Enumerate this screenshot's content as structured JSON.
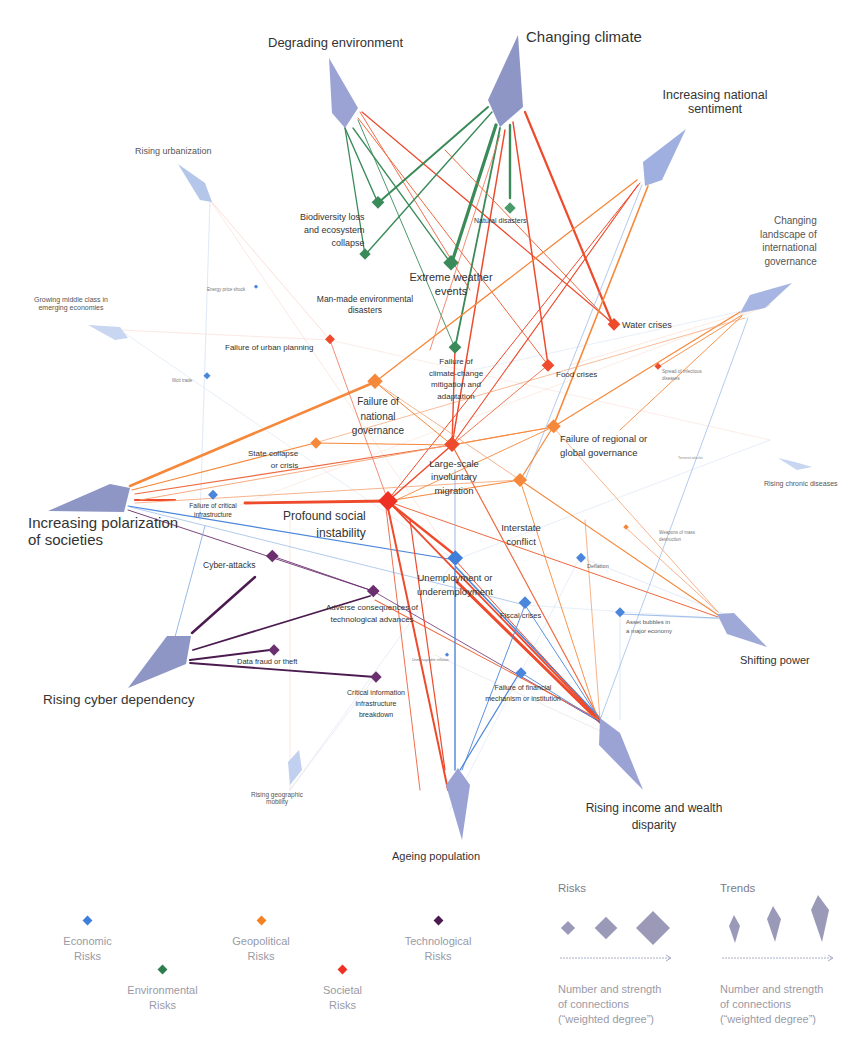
{
  "trends": [
    {
      "id": "degrading_environment",
      "label": "Degrading environment",
      "size": "xl"
    },
    {
      "id": "changing_climate",
      "label": "Changing climate",
      "size": "xl"
    },
    {
      "id": "increasing_national_sentiment",
      "label": "Increasing national sentiment",
      "size": "l"
    },
    {
      "id": "rising_urbanization",
      "label": "Rising urbanization",
      "size": "s"
    },
    {
      "id": "changing_landscape_intl_governance",
      "label": "Changing landscape of international governance",
      "size": "l"
    },
    {
      "id": "growing_middle_class",
      "label": "Growing middle class in emerging economies",
      "size": "s"
    },
    {
      "id": "rising_chronic_diseases",
      "label": "Rising chronic diseases",
      "size": "s"
    },
    {
      "id": "increasing_polarization",
      "label": "Increasing polarization of societies",
      "size": "xl"
    },
    {
      "id": "shifting_power",
      "label": "Shifting power",
      "size": "l"
    },
    {
      "id": "rising_cyber_dependency",
      "label": "Rising cyber dependency",
      "size": "xl"
    },
    {
      "id": "rising_geographic_mobility",
      "label": "Rising geographic mobility",
      "size": "s"
    },
    {
      "id": "ageing_population",
      "label": "Ageing population",
      "size": "l"
    },
    {
      "id": "rising_income_wealth_disparity",
      "label": "Rising income and wealth disparity",
      "size": "xl"
    }
  ],
  "risks": [
    {
      "id": "biodiversity_loss",
      "label": "Biodiversity loss and ecosystem collapse",
      "category": "Environmental"
    },
    {
      "id": "natural_disasters",
      "label": "Natural disasters",
      "category": "Environmental"
    },
    {
      "id": "extreme_weather",
      "label": "Extreme weather events",
      "category": "Environmental"
    },
    {
      "id": "man_made_disasters",
      "label": "Man-made environmental disasters",
      "category": "Environmental"
    },
    {
      "id": "climate_change_failure",
      "label": "Failure of climate-change mitigation and adaptation",
      "category": "Environmental"
    },
    {
      "id": "water_crises",
      "label": "Water crises",
      "category": "Societal"
    },
    {
      "id": "food_crises",
      "label": "Food crises",
      "category": "Societal"
    },
    {
      "id": "urban_planning_failure",
      "label": "Failure of urban planning",
      "category": "Societal"
    },
    {
      "id": "infectious_diseases",
      "label": "Spread of infectious diseases",
      "category": "Societal"
    },
    {
      "id": "involuntary_migration",
      "label": "Large-scale involuntary migration",
      "category": "Societal"
    },
    {
      "id": "social_instability",
      "label": "Profound social instability",
      "category": "Societal"
    },
    {
      "id": "national_governance_failure",
      "label": "Failure of national governance",
      "category": "Geopolitical"
    },
    {
      "id": "state_collapse",
      "label": "State collapse or crisis",
      "category": "Geopolitical"
    },
    {
      "id": "regional_governance_failure",
      "label": "Failure of regional or global governance",
      "category": "Geopolitical"
    },
    {
      "id": "interstate_conflict",
      "label": "Interstate conflict",
      "category": "Geopolitical"
    },
    {
      "id": "wmd",
      "label": "Weapons of mass destruction",
      "category": "Geopolitical"
    },
    {
      "id": "terrorist_attacks",
      "label": "Terrorist attacks",
      "category": "Geopolitical"
    },
    {
      "id": "energy_price_shock",
      "label": "Energy price shock",
      "category": "Economic"
    },
    {
      "id": "illicit_trade",
      "label": "Illicit trade",
      "category": "Economic"
    },
    {
      "id": "critical_infrastructure_failure",
      "label": "Failure of critical infrastructure",
      "category": "Economic"
    },
    {
      "id": "unemployment",
      "label": "Unemployment or underemployment",
      "category": "Economic"
    },
    {
      "id": "deflation",
      "label": "Deflation",
      "category": "Economic"
    },
    {
      "id": "fiscal_crises",
      "label": "Fiscal crises",
      "category": "Economic"
    },
    {
      "id": "asset_bubbles",
      "label": "Asset bubbles in a major economy",
      "category": "Economic"
    },
    {
      "id": "unmanageable_inflation",
      "label": "Unmanageable inflation",
      "category": "Economic"
    },
    {
      "id": "financial_failure",
      "label": "Failure of financial mechanism or institution",
      "category": "Economic"
    },
    {
      "id": "cyber_attacks",
      "label": "Cyber-attacks",
      "category": "Technological"
    },
    {
      "id": "adverse_tech",
      "label": "Adverse consequences of technological advances",
      "category": "Technological"
    },
    {
      "id": "data_fraud",
      "label": "Data fraud or theft",
      "category": "Technological"
    },
    {
      "id": "critical_info_breakdown",
      "label": "Critical information infrastructure breakdown",
      "category": "Technological"
    }
  ],
  "labels": {
    "degrading_environment": "Degrading environment",
    "changing_climate": "Changing climate",
    "increasing_national_sentiment_1": "Increasing national",
    "increasing_national_sentiment_2": "sentiment",
    "rising_urbanization": "Rising urbanization",
    "changing_landscape_1": "Changing",
    "changing_landscape_2": "landscape of",
    "changing_landscape_3": "international",
    "changing_landscape_4": "governance",
    "growing_middle_class_1": "Growing middle class in",
    "growing_middle_class_2": "emerging economies",
    "rising_chronic_diseases": "Rising chronic diseases",
    "increasing_polarization_1": "Increasing polarization",
    "increasing_polarization_2": "of societies",
    "shifting_power": "Shifting power",
    "rising_cyber_dependency": "Rising cyber dependency",
    "rising_geographic_mobility_1": "Rising geographic",
    "rising_geographic_mobility_2": "mobility",
    "ageing_population": "Ageing population",
    "rising_income_1": "Rising income and wealth",
    "rising_income_2": "disparity",
    "biodiversity_1": "Biodiversity loss",
    "biodiversity_2": "and ecosystem",
    "biodiversity_3": "collapse",
    "natural_disasters": "Natural disasters",
    "extreme_weather_1": "Extreme weather",
    "extreme_weather_2": "events",
    "man_made_1": "Man-made environmental",
    "man_made_2": "disasters",
    "water_crises": "Water crises",
    "energy_price_shock": "Energy price shock",
    "urban_planning": "Failure of urban planning",
    "illicit_trade": "Illicit trade",
    "climate_failure_1": "Failure of",
    "climate_failure_2": "climate-change",
    "climate_failure_3": "mitigation and",
    "climate_failure_4": "adaptation",
    "food_crises": "Food crises",
    "infectious_1": "Spread of infectious",
    "infectious_2": "diseases",
    "national_gov_1": "Failure of",
    "national_gov_2": "national",
    "national_gov_3": "governance",
    "state_collapse_1": "State collapse",
    "state_collapse_2": "or crisis",
    "migration_1": "Large-scale",
    "migration_2": "involuntary",
    "migration_3": "migration",
    "regional_gov_1": "Failure of regional or",
    "regional_gov_2": "global governance",
    "terrorist": "Terrorist attacks",
    "critical_infra_1": "Failure of critical",
    "critical_infra_2": "infrastructure",
    "social_instability_1": "Profound social",
    "social_instability_2": "instability",
    "interstate_1": "Interstate",
    "interstate_2": "conflict",
    "wmd_1": "Weapons of mass",
    "wmd_2": "destruction",
    "cyber_attacks": "Cyber-attacks",
    "unemployment_1": "Unemployment or",
    "unemployment_2": "underemployment",
    "deflation": "Deflation",
    "adverse_tech_1": "Adverse consequences of",
    "adverse_tech_2": "technological advances",
    "fiscal_crises": "Fiscal crises",
    "asset_bubbles_1": "Asset bubbles in",
    "asset_bubbles_2": "a major economy",
    "data_fraud": "Data fraud or theft",
    "inflation": "Unmanageable inflation",
    "critical_info_1": "Critical information",
    "critical_info_2": "infrastructure",
    "critical_info_3": "breakdown",
    "financial_1": "Failure of financial",
    "financial_2": "mechanism or institution"
  },
  "legend": {
    "categories": [
      {
        "line1": "Economic",
        "line2": "Risks",
        "color": "#3f7fd9"
      },
      {
        "line1": "Environmental",
        "line2": "Risks",
        "color": "#2e7d4f"
      },
      {
        "line1": "Geopolitical",
        "line2": "Risks",
        "color": "#f58220"
      },
      {
        "line1": "Societal",
        "line2": "Risks",
        "color": "#ee3124"
      },
      {
        "line1": "Technological",
        "line2": "Risks",
        "color": "#4b1a4f"
      }
    ],
    "risks_title": "Risks",
    "trends_title": "Trends",
    "desc_line1": "Number and strength",
    "desc_line2": "of connections",
    "desc_line3": "(“weighted degree”)"
  },
  "colors": {
    "economic": "#4a86dc",
    "environmental": "#3b8a5a",
    "geopolitical": "#f5883a",
    "societal": "#ee4a2c",
    "technological": "#6b2e6e",
    "trend": "#9aa3d4"
  }
}
